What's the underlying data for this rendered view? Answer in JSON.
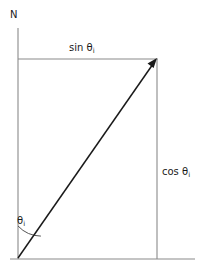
{
  "figure": {
    "background_color": "#ffffff",
    "line_color_axis": "#808080",
    "line_color_vector": "#1a1a1a",
    "text_color": "#1a1a1a",
    "labels": {
      "north": "N",
      "sin_component": "sin θ",
      "sin_component_subscript": "i",
      "cos_component": "cos θ",
      "cos_component_subscript": "i",
      "angle": "θ",
      "angle_subscript": "i"
    },
    "geometry": {
      "origin_x": 18,
      "origin_y": 258,
      "tip_x": 157,
      "tip_y": 59,
      "top_line_y": 59,
      "bottom_line_y": 259,
      "left_axis_x": 18,
      "right_line_x": 157,
      "arc_radius": 32
    }
  }
}
